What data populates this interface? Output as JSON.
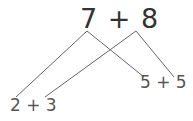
{
  "diagram": {
    "top_expression": "7 + 8",
    "left_branch": "2 + 3",
    "right_branch": "5 + 5",
    "line_color": "#555555"
  }
}
